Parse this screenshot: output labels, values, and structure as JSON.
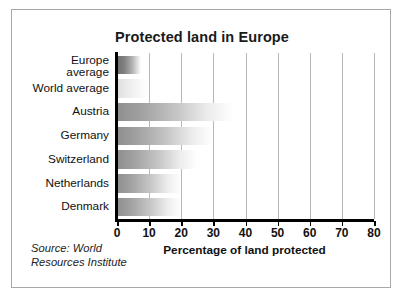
{
  "chart_data": {
    "type": "bar",
    "orientation": "horizontal",
    "title": "Protected land in Europe",
    "xlabel": "Percentage of land protected",
    "ylabel": "",
    "xlim": [
      0,
      80
    ],
    "xticks": [
      "0",
      "10",
      "20",
      "30",
      "40",
      "50",
      "60",
      "70",
      "80"
    ],
    "grid": "vertical gridlines at each x tick",
    "legend": "none",
    "categories": [
      "Europe\naverage",
      "World average",
      "Austria",
      "Germany",
      "Switzerland",
      "Netherlands",
      "Denmark"
    ],
    "values": [
      7.5,
      10,
      36,
      30,
      25,
      20,
      20
    ],
    "annotations": [
      "Source: World Resources Institute"
    ]
  },
  "chart": {
    "title": "Protected land in Europe",
    "axis_title": "Percentage of land protected",
    "bars": [
      {
        "label_line1": "Europe",
        "label_line2": "average",
        "value": 7.5,
        "style": "dark"
      },
      {
        "label_line1": "World average",
        "label_line2": "",
        "value": 10,
        "style": "light"
      },
      {
        "label_line1": "Austria",
        "label_line2": "",
        "value": 36,
        "style": "mid"
      },
      {
        "label_line1": "Germany",
        "label_line2": "",
        "value": 30,
        "style": "mid"
      },
      {
        "label_line1": "Switzerland",
        "label_line2": "",
        "value": 25,
        "style": "mid"
      },
      {
        "label_line1": "Netherlands",
        "label_line2": "",
        "value": 20,
        "style": "mid"
      },
      {
        "label_line1": "Denmark",
        "label_line2": "",
        "value": 20,
        "style": "mid"
      }
    ],
    "ticks": [
      "0",
      "10",
      "20",
      "30",
      "40",
      "50",
      "60",
      "70",
      "80"
    ]
  },
  "source": {
    "line1": "Source: World",
    "line2": "Resources Institute"
  },
  "colors": {
    "frame_border": "#a8a8a8",
    "axis": "#000000",
    "gridline": "#b9b9b9",
    "text": "#111111",
    "bar_dark": "#6f6f6f",
    "bar_light": "#dedede",
    "background": "#ffffff"
  }
}
